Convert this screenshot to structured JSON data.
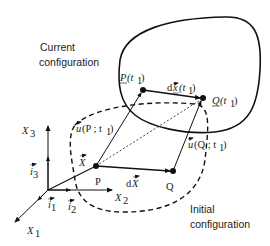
{
  "diagram": {
    "type": "continuum-mechanics-kinematics",
    "colors": {
      "stroke": "#111111",
      "text": "#222222",
      "background": "#ffffff"
    },
    "regions": {
      "current": {
        "label_line1": "Current",
        "label_line2": "configuration",
        "style": "solid"
      },
      "initial": {
        "label_line1": "Initial",
        "label_line2": "configuration",
        "style": "dashed"
      }
    },
    "axes": {
      "x1": "X",
      "x1_sub": "1",
      "x2": "X",
      "x2_sub": "2",
      "x3": "X",
      "x3_sub": "3",
      "i1": "i",
      "i1_sub": "1",
      "i2": "i",
      "i2_sub": "2",
      "i3": "i",
      "i3_sub": "3"
    },
    "points": {
      "P": "P",
      "Q": "Q",
      "P_t1": "P",
      "P_t1_arg": "(t",
      "P_t1_sub": "1",
      "P_t1_close": ")",
      "Q_t1": "Q",
      "Q_t1_arg": "(t",
      "Q_t1_sub": "1",
      "Q_t1_close": ")"
    },
    "vectors": {
      "X": "X",
      "dX_d": "d",
      "dX": "X",
      "dx_d": "d",
      "dx": "x",
      "dx_arg": "(t",
      "dx_sub": "1",
      "dx_close": ")",
      "uP": "u",
      "uP_arg": "(P ; t",
      "uP_sub": "1",
      "uP_close": ")",
      "uQ": "u",
      "uQ_arg": "(Q ; t",
      "uQ_sub": "1",
      "uQ_close": ")"
    }
  }
}
